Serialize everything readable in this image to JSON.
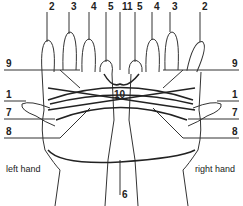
{
  "figure": {
    "type": "string-figure-diagram",
    "captions": {
      "left": "left hand",
      "right": "right hand"
    },
    "labels": {
      "top": [
        "2",
        "3",
        "4",
        "5",
        "11",
        "5",
        "4",
        "3",
        "2"
      ],
      "left_side": [
        "9",
        "1",
        "7",
        "8"
      ],
      "right_side": [
        "9",
        "1",
        "7",
        "8"
      ],
      "center": "10",
      "bottom": "6"
    }
  }
}
